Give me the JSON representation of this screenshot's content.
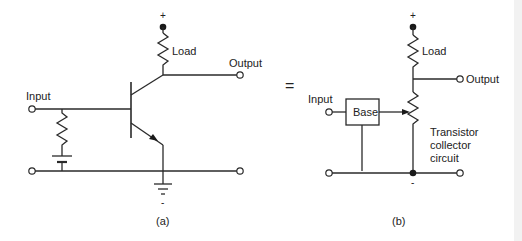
{
  "figure": {
    "panel_a": {
      "caption": "(a)",
      "labels": {
        "plus": "+",
        "load": "Load",
        "output": "Output",
        "input": "Input",
        "minus": "-"
      }
    },
    "equals_sign": "=",
    "panel_b": {
      "caption": "(b)",
      "labels": {
        "plus": "+",
        "load": "Load",
        "output": "Output",
        "input": "Input",
        "base": "Base",
        "transistor_line1": "Transistor",
        "transistor_line2": "collector",
        "transistor_line3": "circuit",
        "minus": "-"
      }
    },
    "colors": {
      "line": "#2a2a2a",
      "background": "#ffffff"
    }
  }
}
